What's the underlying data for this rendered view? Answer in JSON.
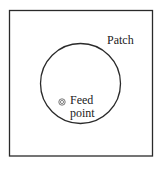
{
  "figure": {
    "width": 164,
    "height": 172,
    "background": "#ffffff",
    "stroke_color": "#2a2a2a"
  },
  "substrate": {
    "shape": "square",
    "x": 9.5,
    "y": 10.5,
    "width": 143,
    "height": 145.5
  },
  "patch": {
    "shape": "circle",
    "cx": 80.5,
    "cy": 83.5,
    "r": 40,
    "label": "Patch"
  },
  "feed_point": {
    "cx": 62,
    "cy": 102,
    "outer_r": 3.2,
    "inner_r": 1.6,
    "label_line1": "Feed",
    "label_line2": "point"
  }
}
